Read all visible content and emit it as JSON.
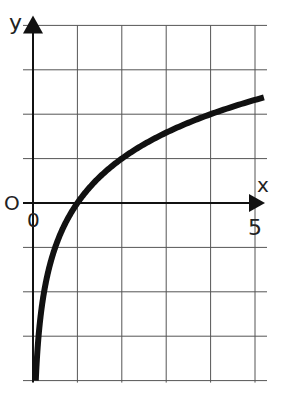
{
  "chart_data": {
    "type": "line",
    "title": "",
    "function": "y = log2(x)",
    "xlabel": "x",
    "ylabel": "y",
    "x_ticks_labeled": [
      "0",
      "5"
    ],
    "y_ticks_labeled": [
      "0"
    ],
    "xlim": [
      0,
      5
    ],
    "ylim": [
      -4,
      4
    ],
    "grid": true,
    "grid_step": 1,
    "series": [
      {
        "name": "curve",
        "x": [
          0.0625,
          0.125,
          0.25,
          0.5,
          1,
          1.5,
          2,
          2.5,
          3,
          3.5,
          4,
          4.5,
          5.2
        ],
        "y": [
          -4,
          -3,
          -2,
          -1,
          0,
          0.585,
          1,
          1.32,
          1.585,
          1.807,
          2,
          2.17,
          2.38
        ]
      }
    ]
  },
  "labels": {
    "x_axis": "x",
    "y_axis": "y",
    "origin_y": "O",
    "origin_x": "0",
    "x_end": "5"
  },
  "colors": {
    "curve": "#111111",
    "grid": "#555555",
    "axis": "#111111"
  }
}
